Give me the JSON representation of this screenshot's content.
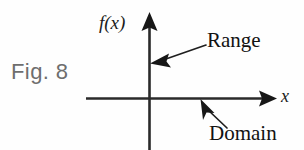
{
  "figure": {
    "caption": "Fig. 8",
    "background_color": "#fefefe",
    "ink_color": "#1b1b1b",
    "caption_color": "#6e6e6e",
    "width": 304,
    "height": 150
  },
  "axes": {
    "vertical": {
      "label": "f(x)",
      "icon": "arrow-up-icon",
      "x": 149,
      "top": 12,
      "bottom": 150,
      "arrowhead": "solid-triangle-up"
    },
    "horizontal": {
      "label": "x",
      "icon": "arrow-right-icon",
      "y": 98,
      "left": 86,
      "right": 277,
      "arrowhead": "solid-triangle-right"
    },
    "origin": {
      "x": 149,
      "y": 98
    }
  },
  "annotations": [
    {
      "id": "range",
      "label": "Range",
      "icon": "leader-arrow-left-icon",
      "points_to": "vertical-axis",
      "tip": {
        "x": 150,
        "y": 63
      },
      "tail": {
        "x": 206,
        "y": 45
      }
    },
    {
      "id": "domain",
      "label": "Domain",
      "icon": "leader-arrow-upleft-icon",
      "points_to": "horizontal-axis",
      "tip": {
        "x": 201,
        "y": 99
      },
      "tail": {
        "x": 227,
        "y": 128
      }
    }
  ]
}
